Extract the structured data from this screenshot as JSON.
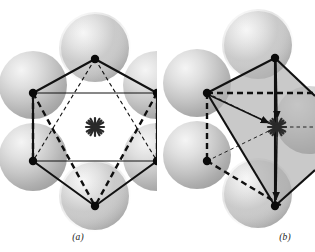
{
  "figure": {
    "background_color": "#ffffff",
    "width": 315,
    "height": 252,
    "panel_count": 2
  },
  "colors": {
    "line": "#111111",
    "vertex": "#0a0a0a",
    "sphere_light": "#f2f2f2",
    "sphere_mid": "#c9c9c9",
    "sphere_dark": "#9a9a9a",
    "sphere_edge": "#b5b5b5",
    "face_shade": "#b0b0b0",
    "caption": "#1a1a1a",
    "asterisk": "#2a2a2a"
  },
  "panels": [
    {
      "id": "a",
      "caption": "(a)",
      "description": "Octahedral coordination: six close-packed spheres arranged hexagonally around a central interstitial site marked by an asterisk.",
      "sphere_count": 6,
      "vertex_count": 6,
      "center_marker": "asterisk",
      "polyhedron": "octahedron",
      "spheres": [
        {
          "name": "sphere-top",
          "cx": 95,
          "cy": 48,
          "r": 34
        },
        {
          "name": "sphere-upper-left",
          "cx": 33,
          "cy": 85,
          "r": 34
        },
        {
          "name": "sphere-upper-right",
          "cx": 157,
          "cy": 85,
          "r": 34
        },
        {
          "name": "sphere-lower-left",
          "cx": 33,
          "cy": 157,
          "r": 34
        },
        {
          "name": "sphere-lower-right",
          "cx": 157,
          "cy": 157,
          "r": 34
        },
        {
          "name": "sphere-bottom",
          "cx": 95,
          "cy": 196,
          "r": 34
        }
      ],
      "vertices": [
        {
          "name": "vertex-top",
          "x": 95,
          "y": 59
        },
        {
          "name": "vertex-upper-left",
          "x": 33,
          "y": 93
        },
        {
          "name": "vertex-upper-right",
          "x": 157,
          "y": 93
        },
        {
          "name": "vertex-lower-left",
          "x": 33,
          "y": 161
        },
        {
          "name": "vertex-lower-right",
          "x": 157,
          "y": 161
        },
        {
          "name": "vertex-bottom",
          "x": 95,
          "y": 206
        }
      ],
      "center": {
        "x": 95,
        "y": 127
      },
      "edge_styles": [
        "solid-outline",
        "thin-solid-horizontal",
        "dashed-internal",
        "heavy-dashed"
      ]
    },
    {
      "id": "b",
      "caption": "(b)",
      "description": "Tetrahedral coordination: four spheres form a shaded tetrahedron around a central interstitial site marked by an asterisk, with directional arrows toward the center.",
      "sphere_count": 5,
      "vertex_count": 4,
      "center_marker": "asterisk",
      "polyhedron": "tetrahedron",
      "shaded_face": true,
      "arrow_count": 3,
      "spheres": [
        {
          "name": "sphere-upper-right",
          "cx": 101,
          "cy": 45,
          "r": 34
        },
        {
          "name": "sphere-upper-left",
          "cx": 40,
          "cy": 83,
          "r": 34
        },
        {
          "name": "sphere-lower-left",
          "cx": 40,
          "cy": 155,
          "r": 34
        },
        {
          "name": "sphere-lower-right",
          "cx": 101,
          "cy": 194,
          "r": 34
        },
        {
          "name": "sphere-right-edge",
          "cx": 152,
          "cy": 120,
          "r": 34
        }
      ],
      "vertices": [
        {
          "name": "vertex-top",
          "x": 118,
          "y": 58
        },
        {
          "name": "vertex-left",
          "x": 50,
          "y": 93
        },
        {
          "name": "vertex-bottom-left",
          "x": 50,
          "y": 161
        },
        {
          "name": "vertex-bottom",
          "x": 118,
          "y": 206
        }
      ],
      "center": {
        "x": 120,
        "y": 127
      },
      "edge_styles": [
        "solid-outline",
        "dashed-hidden",
        "heavy-dashed",
        "arrow-to-center"
      ]
    }
  ]
}
